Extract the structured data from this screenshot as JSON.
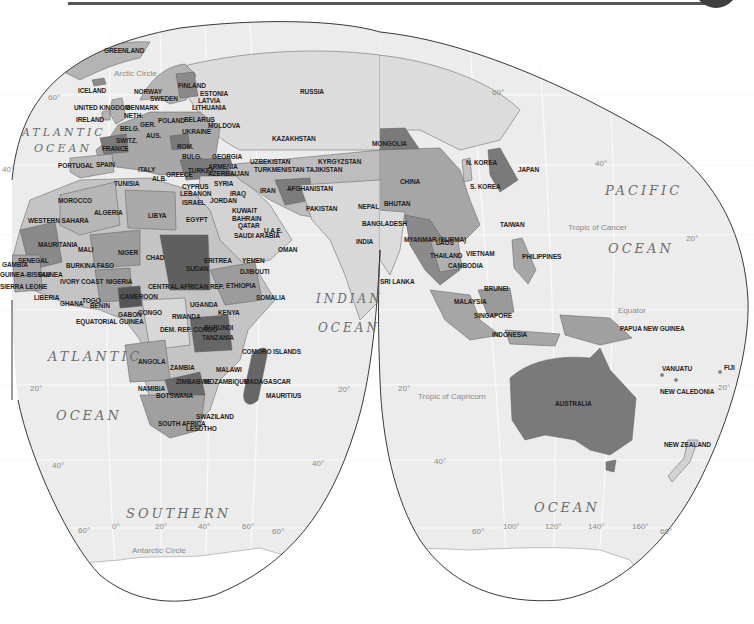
{
  "map": {
    "projection": "interrupted",
    "colors": {
      "ocean": "#ececec",
      "land_light": "#d6d6d6",
      "land_mid": "#b4b4b4",
      "land_dark": "#8a8a8a",
      "land_darker": "#6f6f6f",
      "outline": "#3a3a3a",
      "header_tab": "#3f3f3f"
    },
    "oceans": [
      {
        "text": "ATLANTIC",
        "x": 22,
        "y": 126,
        "size": 11
      },
      {
        "text": "OCEAN",
        "x": 34,
        "y": 142,
        "size": 11
      },
      {
        "text": "ATLANTIC",
        "x": 48,
        "y": 349,
        "size": 13
      },
      {
        "text": "OCEAN",
        "x": 56,
        "y": 408,
        "size": 13
      },
      {
        "text": "INDIAN",
        "x": 316,
        "y": 292,
        "size": 12
      },
      {
        "text": "OCEAN",
        "x": 318,
        "y": 321,
        "size": 12
      },
      {
        "text": "PACIFIC",
        "x": 605,
        "y": 183,
        "size": 13
      },
      {
        "text": "OCEAN",
        "x": 608,
        "y": 241,
        "size": 13
      },
      {
        "text": "SOUTHERN",
        "x": 126,
        "y": 506,
        "size": 13
      },
      {
        "text": "OCEAN",
        "x": 534,
        "y": 500,
        "size": 13
      }
    ],
    "lines": [
      {
        "text": "Arctic Circle",
        "x": 114,
        "y": 69
      },
      {
        "text": "Tropic of Cancer",
        "x": 568,
        "y": 223
      },
      {
        "text": "Equator",
        "x": 618,
        "y": 306
      },
      {
        "text": "Tropic of Capricorn",
        "x": 418,
        "y": 392
      },
      {
        "text": "Antarctic Circle",
        "x": 132,
        "y": 546
      }
    ],
    "degrees": [
      {
        "text": "60°",
        "x": 48,
        "y": 93
      },
      {
        "text": "40°",
        "x": 2,
        "y": 165
      },
      {
        "text": "60°",
        "x": 492,
        "y": 88
      },
      {
        "text": "40°",
        "x": 595,
        "y": 159
      },
      {
        "text": "20°",
        "x": 686,
        "y": 234
      },
      {
        "text": "20°",
        "x": 338,
        "y": 385
      },
      {
        "text": "20°",
        "x": 398,
        "y": 384
      },
      {
        "text": "20°",
        "x": 718,
        "y": 383
      },
      {
        "text": "20°",
        "x": 30,
        "y": 384
      },
      {
        "text": "40°",
        "x": 52,
        "y": 461
      },
      {
        "text": "40°",
        "x": 312,
        "y": 459
      },
      {
        "text": "40°",
        "x": 434,
        "y": 457
      },
      {
        "text": "60°",
        "x": 78,
        "y": 526
      },
      {
        "text": "0°",
        "x": 112,
        "y": 522
      },
      {
        "text": "20°",
        "x": 155,
        "y": 522
      },
      {
        "text": "40°",
        "x": 198,
        "y": 522
      },
      {
        "text": "60°",
        "x": 242,
        "y": 522
      },
      {
        "text": "60°",
        "x": 272,
        "y": 527
      },
      {
        "text": "60°",
        "x": 472,
        "y": 527
      },
      {
        "text": "100°",
        "x": 503,
        "y": 522
      },
      {
        "text": "120°",
        "x": 545,
        "y": 522
      },
      {
        "text": "140°",
        "x": 588,
        "y": 522
      },
      {
        "text": "160°",
        "x": 632,
        "y": 522
      },
      {
        "text": "60°",
        "x": 660,
        "y": 527
      }
    ],
    "countries": [
      {
        "name": "GREENLAND",
        "x": 104,
        "y": 47
      },
      {
        "name": "ICELAND",
        "x": 78,
        "y": 87
      },
      {
        "name": "NORWAY",
        "x": 134,
        "y": 88
      },
      {
        "name": "SWEDEN",
        "x": 150,
        "y": 95
      },
      {
        "name": "FINLAND",
        "x": 178,
        "y": 82
      },
      {
        "name": "ESTONIA",
        "x": 200,
        "y": 90
      },
      {
        "name": "LATVIA",
        "x": 198,
        "y": 97
      },
      {
        "name": "LITHUANIA",
        "x": 192,
        "y": 104
      },
      {
        "name": "RUSSIA",
        "x": 300,
        "y": 88
      },
      {
        "name": "UNITED KINGDOM",
        "x": 74,
        "y": 104
      },
      {
        "name": "DENMARK",
        "x": 126,
        "y": 104
      },
      {
        "name": "NETH.",
        "x": 124,
        "y": 112
      },
      {
        "name": "IRELAND",
        "x": 76,
        "y": 116
      },
      {
        "name": "GER.",
        "x": 140,
        "y": 121
      },
      {
        "name": "POLAND",
        "x": 158,
        "y": 117
      },
      {
        "name": "BELARUS",
        "x": 184,
        "y": 116
      },
      {
        "name": "MOLDOVA",
        "x": 208,
        "y": 122
      },
      {
        "name": "BELG.",
        "x": 120,
        "y": 125
      },
      {
        "name": "UKRAINE",
        "x": 182,
        "y": 128
      },
      {
        "name": "KAZAKHSTAN",
        "x": 272,
        "y": 135
      },
      {
        "name": "SWITZ.",
        "x": 116,
        "y": 137
      },
      {
        "name": "AUS.",
        "x": 146,
        "y": 132
      },
      {
        "name": "FRANCE",
        "x": 102,
        "y": 145
      },
      {
        "name": "ROM.",
        "x": 177,
        "y": 143
      },
      {
        "name": "MONGOLIA",
        "x": 372,
        "y": 140
      },
      {
        "name": "GEORGIA",
        "x": 212,
        "y": 153
      },
      {
        "name": "UZBEKISTAN",
        "x": 250,
        "y": 158
      },
      {
        "name": "KYRGYZSTAN",
        "x": 318,
        "y": 158
      },
      {
        "name": "N. KOREA",
        "x": 466,
        "y": 159
      },
      {
        "name": "JAPAN",
        "x": 518,
        "y": 166
      },
      {
        "name": "PORTUGAL",
        "x": 58,
        "y": 162
      },
      {
        "name": "SPAIN",
        "x": 96,
        "y": 161
      },
      {
        "name": "ITALY",
        "x": 138,
        "y": 166
      },
      {
        "name": "BULG.",
        "x": 182,
        "y": 153
      },
      {
        "name": "TURKEY",
        "x": 188,
        "y": 167
      },
      {
        "name": "ARMENIA",
        "x": 208,
        "y": 163
      },
      {
        "name": "AZERBAIJAN",
        "x": 208,
        "y": 170
      },
      {
        "name": "TURKMENISTAN",
        "x": 254,
        "y": 166
      },
      {
        "name": "TAJIKISTAN",
        "x": 306,
        "y": 166
      },
      {
        "name": "CHINA",
        "x": 400,
        "y": 178
      },
      {
        "name": "S. KOREA",
        "x": 470,
        "y": 183
      },
      {
        "name": "ALB.",
        "x": 152,
        "y": 175
      },
      {
        "name": "GREECE",
        "x": 166,
        "y": 171
      },
      {
        "name": "IRAN",
        "x": 260,
        "y": 187
      },
      {
        "name": "AFGHANISTAN",
        "x": 287,
        "y": 185
      },
      {
        "name": "TUNISIA",
        "x": 114,
        "y": 180
      },
      {
        "name": "CYPRUS",
        "x": 182,
        "y": 183
      },
      {
        "name": "LEBANON",
        "x": 180,
        "y": 190
      },
      {
        "name": "SYRIA",
        "x": 214,
        "y": 180
      },
      {
        "name": "IRAQ",
        "x": 230,
        "y": 190
      },
      {
        "name": "BHUTAN",
        "x": 384,
        "y": 200
      },
      {
        "name": "NEPAL",
        "x": 358,
        "y": 203
      },
      {
        "name": "TAIWAN",
        "x": 500,
        "y": 221
      },
      {
        "name": "MOROCCO",
        "x": 58,
        "y": 197
      },
      {
        "name": "ISRAEL",
        "x": 182,
        "y": 199
      },
      {
        "name": "JORDAN",
        "x": 210,
        "y": 197
      },
      {
        "name": "PAKISTAN",
        "x": 306,
        "y": 205
      },
      {
        "name": "ALGERIA",
        "x": 94,
        "y": 209
      },
      {
        "name": "LIBYA",
        "x": 148,
        "y": 212
      },
      {
        "name": "KUWAIT",
        "x": 232,
        "y": 207
      },
      {
        "name": "BAHRAIN",
        "x": 232,
        "y": 215
      },
      {
        "name": "QATAR",
        "x": 238,
        "y": 222
      },
      {
        "name": "BANGLADESH",
        "x": 362,
        "y": 220
      },
      {
        "name": "EGYPT",
        "x": 186,
        "y": 216
      },
      {
        "name": "U.A.E.",
        "x": 264,
        "y": 227
      },
      {
        "name": "WESTERN SAHARA",
        "x": 28,
        "y": 217
      },
      {
        "name": "SAUDI ARABIA",
        "x": 234,
        "y": 232
      },
      {
        "name": "INDIA",
        "x": 356,
        "y": 238
      },
      {
        "name": "MYANMAR (BURMA)",
        "x": 404,
        "y": 236
      },
      {
        "name": "LAOS",
        "x": 436,
        "y": 239
      },
      {
        "name": "MAURITANIA",
        "x": 38,
        "y": 241
      },
      {
        "name": "MALI",
        "x": 78,
        "y": 246
      },
      {
        "name": "NIGER",
        "x": 118,
        "y": 249
      },
      {
        "name": "CHAD",
        "x": 146,
        "y": 254
      },
      {
        "name": "OMAN",
        "x": 278,
        "y": 246
      },
      {
        "name": "THAILAND",
        "x": 430,
        "y": 252
      },
      {
        "name": "VIETNAM",
        "x": 466,
        "y": 250
      },
      {
        "name": "PHILIPPINES",
        "x": 522,
        "y": 253
      },
      {
        "name": "CAMBODIA",
        "x": 448,
        "y": 262
      },
      {
        "name": "SENEGAL",
        "x": 18,
        "y": 257
      },
      {
        "name": "GAMBIA",
        "x": 2,
        "y": 261
      },
      {
        "name": "BURKINA FASO",
        "x": 66,
        "y": 262
      },
      {
        "name": "SUDAN",
        "x": 186,
        "y": 265
      },
      {
        "name": "ERITREA",
        "x": 204,
        "y": 257
      },
      {
        "name": "YEMEN",
        "x": 242,
        "y": 257
      },
      {
        "name": "GUINEA-BISSAU",
        "x": 0,
        "y": 271
      },
      {
        "name": "GUINEA",
        "x": 38,
        "y": 271
      },
      {
        "name": "IVORY COAST",
        "x": 60,
        "y": 278
      },
      {
        "name": "NIGERIA",
        "x": 106,
        "y": 278
      },
      {
        "name": "DJIBOUTI",
        "x": 240,
        "y": 268
      },
      {
        "name": "SIERRA LEONE",
        "x": 0,
        "y": 283
      },
      {
        "name": "CENTRAL AFRICAN REP.",
        "x": 148,
        "y": 283
      },
      {
        "name": "ETHIOPIA",
        "x": 226,
        "y": 282
      },
      {
        "name": "SRI LANKA",
        "x": 380,
        "y": 278
      },
      {
        "name": "BRUNEI",
        "x": 484,
        "y": 285
      },
      {
        "name": "LIBERIA",
        "x": 34,
        "y": 294
      },
      {
        "name": "CAMEROON",
        "x": 120,
        "y": 293
      },
      {
        "name": "SOMALIA",
        "x": 256,
        "y": 294
      },
      {
        "name": "MALAYSIA",
        "x": 454,
        "y": 298
      },
      {
        "name": "GHANA",
        "x": 60,
        "y": 300
      },
      {
        "name": "TOGO",
        "x": 82,
        "y": 297
      },
      {
        "name": "BENIN",
        "x": 90,
        "y": 302
      },
      {
        "name": "UGANDA",
        "x": 190,
        "y": 301
      },
      {
        "name": "GABON",
        "x": 118,
        "y": 311
      },
      {
        "name": "CONGO",
        "x": 138,
        "y": 309
      },
      {
        "name": "KENYA",
        "x": 218,
        "y": 309
      },
      {
        "name": "SINGAPORE",
        "x": 474,
        "y": 312
      },
      {
        "name": "PAPUA NEW GUINEA",
        "x": 620,
        "y": 325
      },
      {
        "name": "EQUATORIAL GUINEA",
        "x": 76,
        "y": 318
      },
      {
        "name": "RWANDA",
        "x": 172,
        "y": 313
      },
      {
        "name": "DEM. REP. CONGO",
        "x": 160,
        "y": 326
      },
      {
        "name": "BURUNDI",
        "x": 204,
        "y": 324
      },
      {
        "name": "TANZANIA",
        "x": 202,
        "y": 334
      },
      {
        "name": "INDONESIA",
        "x": 492,
        "y": 331
      },
      {
        "name": "COMORO ISLANDS",
        "x": 242,
        "y": 348
      },
      {
        "name": "ANGOLA",
        "x": 138,
        "y": 358
      },
      {
        "name": "ZAMBIA",
        "x": 170,
        "y": 364
      },
      {
        "name": "MALAWI",
        "x": 216,
        "y": 366
      },
      {
        "name": "VANUATU",
        "x": 662,
        "y": 365
      },
      {
        "name": "FIJI",
        "x": 724,
        "y": 364
      },
      {
        "name": "ZIMBABWE",
        "x": 176,
        "y": 378
      },
      {
        "name": "MOZAMBIQUE",
        "x": 204,
        "y": 378
      },
      {
        "name": "MADAGASCAR",
        "x": 244,
        "y": 378
      },
      {
        "name": "NAMIBIA",
        "x": 138,
        "y": 385
      },
      {
        "name": "NEW CALEDONIA",
        "x": 660,
        "y": 388
      },
      {
        "name": "AUSTRALIA",
        "x": 555,
        "y": 400
      },
      {
        "name": "BOTSWANA",
        "x": 156,
        "y": 392
      },
      {
        "name": "MAURITIUS",
        "x": 266,
        "y": 392
      },
      {
        "name": "SWAZILAND",
        "x": 196,
        "y": 413
      },
      {
        "name": "SOUTH AFRICA",
        "x": 158,
        "y": 420
      },
      {
        "name": "LESOTHO",
        "x": 186,
        "y": 425
      },
      {
        "name": "NEW ZEALAND",
        "x": 664,
        "y": 441
      }
    ]
  }
}
